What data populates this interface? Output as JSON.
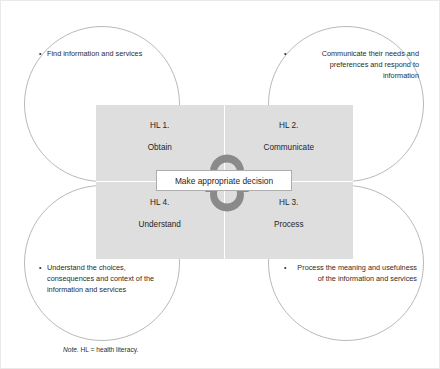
{
  "figure": {
    "center": {
      "label": "Make appropriate decision"
    },
    "note": {
      "lead": "Note.",
      "text": " HL = health literacy."
    },
    "colors": {
      "quadrant_fill": "#dedede",
      "quadrant_divider": "#ffffff",
      "circle_stroke": "#b9b9b9",
      "arrow": "#8a8a8a",
      "text": "#262626",
      "box_border": "#adadad",
      "frame": "#e9e9e9"
    },
    "quadrants": [
      {
        "id": "hl1",
        "number": "HL 1.",
        "name": "Obtain",
        "position": "top-left"
      },
      {
        "id": "hl2",
        "number": "HL 2.",
        "name": "Communicate",
        "position": "top-right"
      },
      {
        "id": "hl3",
        "number": "HL 3.",
        "name": "Process",
        "position": "bottom-right"
      },
      {
        "id": "hl4",
        "number": "HL 4.",
        "name": "Understand",
        "position": "bottom-left"
      }
    ],
    "lobes": [
      {
        "id": "lobe-tl",
        "position": "top-left",
        "align": "left",
        "bullet": "•",
        "text": "Find information and services"
      },
      {
        "id": "lobe-tr",
        "position": "top-right",
        "align": "right",
        "bullet": "•",
        "text": "Communicate their needs and preferences and respond to information"
      },
      {
        "id": "lobe-bl",
        "position": "bottom-left",
        "align": "left",
        "bullet": "•",
        "text": "Understand the choices, consequences and context of the information and services"
      },
      {
        "id": "lobe-br",
        "position": "bottom-right",
        "align": "right",
        "bullet": "•",
        "text": "Process the meaning and usefulness of the information and services"
      }
    ],
    "arrows": [
      {
        "id": "arrow-top",
        "direction": "clockwise",
        "icon": "circular-arrow-clockwise-icon"
      },
      {
        "id": "arrow-bottom",
        "direction": "counter-clockwise",
        "icon": "circular-arrow-counterclockwise-icon"
      }
    ]
  }
}
